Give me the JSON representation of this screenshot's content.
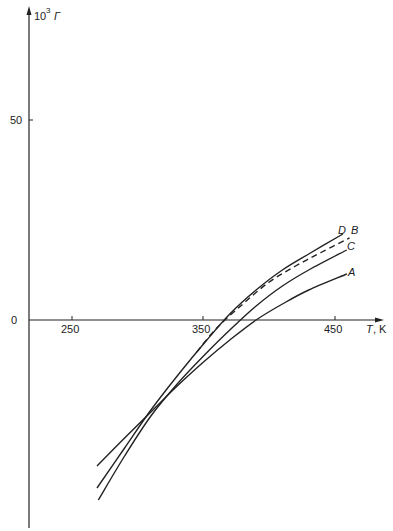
{
  "chart_data": {
    "type": "line",
    "title": "",
    "xlabel": "T, K",
    "ylabel": "10^3 Γ",
    "ylabel_parts": {
      "base": "10",
      "exp": "3",
      "symbol": "Γ"
    },
    "xlabel_parts": {
      "symbol": "T",
      "unit": ", K"
    },
    "x_ticks": [
      250,
      350,
      450
    ],
    "y_ticks": [
      0,
      50
    ],
    "xlim": [
      222,
      470
    ],
    "ylim": [
      -55,
      80
    ],
    "grid": false,
    "legend": "inline curve labels at right end",
    "series": [
      {
        "name": "D",
        "style": "solid",
        "x": [
          269,
          290,
          310,
          330,
          350,
          370,
          390,
          410,
          430,
          456
        ],
        "y": [
          -42,
          -32,
          -22.5,
          -14,
          -6,
          1.5,
          7.5,
          12.5,
          16.5,
          21.5
        ]
      },
      {
        "name": "B",
        "style": "dashed",
        "x": [
          345,
          360,
          380,
          400,
          420,
          440,
          461
        ],
        "y": [
          -8,
          -2,
          4,
          9.5,
          13.5,
          17,
          20.5
        ]
      },
      {
        "name": "C",
        "style": "solid",
        "x": [
          270,
          290,
          310,
          330,
          350,
          370,
          390,
          410,
          430,
          459
        ],
        "y": [
          -45,
          -34,
          -24,
          -16,
          -9,
          -2.5,
          3.5,
          8.5,
          12.5,
          17.5
        ]
      },
      {
        "name": "A",
        "style": "solid",
        "x": [
          269,
          290,
          310,
          330,
          350,
          370,
          390,
          410,
          430,
          459
        ],
        "y": [
          -36.5,
          -29.5,
          -23,
          -16.5,
          -10.5,
          -5,
          0,
          4,
          7.5,
          11.5
        ]
      }
    ]
  },
  "labels": {
    "y_axis_base": "10",
    "y_axis_exp": "3",
    "y_axis_symbol": "Γ",
    "x_axis_symbol": "T",
    "x_axis_unit": ", K",
    "y_tick_50": "50",
    "y_tick_0": "0",
    "x_tick_250": "250",
    "x_tick_350": "350",
    "x_tick_450": "450",
    "curve_D": "D",
    "curve_B": "B",
    "curve_C": "C",
    "curve_A": "A"
  }
}
